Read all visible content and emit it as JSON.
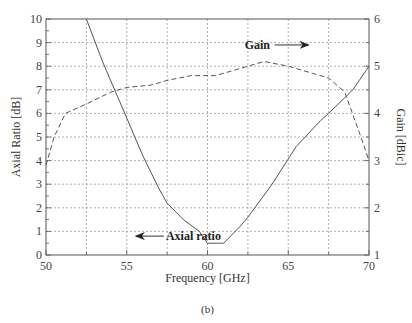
{
  "chart_data": {
    "type": "line",
    "title": "",
    "caption": "(b)",
    "xlabel": "Frequency [GHz]",
    "ylabel_left": "Axial Ratio [dB]",
    "ylabel_right": "Gain [dBic]",
    "xlim": [
      50,
      70
    ],
    "ylim_left": [
      0,
      10
    ],
    "ylim_right": [
      1,
      6
    ],
    "x_ticks": [
      "50",
      "55",
      "60",
      "65",
      "70"
    ],
    "y_left_ticks": [
      "0",
      "1",
      "2",
      "3",
      "4",
      "5",
      "6",
      "7",
      "8",
      "9",
      "10"
    ],
    "y_right_ticks": [
      "1",
      "2",
      "3",
      "4",
      "5",
      "6"
    ],
    "grid": true,
    "series": [
      {
        "name": "Axial ratio",
        "axis": "left",
        "style": "solid",
        "x": [
          52.5,
          53.5,
          55,
          56,
          57,
          57.5,
          58.5,
          59.5,
          60,
          61,
          62,
          62.5,
          64,
          65.5,
          67,
          67.5,
          69,
          70
        ],
        "values": [
          10,
          8.2,
          5.8,
          4.2,
          2.8,
          2.2,
          1.5,
          1.0,
          0.5,
          0.5,
          1.2,
          1.6,
          3.0,
          4.6,
          5.7,
          6.0,
          7.0,
          8.0
        ]
      },
      {
        "name": "Gain",
        "axis": "right",
        "style": "dashed",
        "x": [
          50,
          50.5,
          51.2,
          52.5,
          54,
          55,
          56.5,
          57.5,
          59,
          60.5,
          62,
          63.5,
          65,
          66.5,
          67.5,
          68.5,
          69.5,
          70
        ],
        "values": [
          2.9,
          3.5,
          4.0,
          4.2,
          4.45,
          4.55,
          4.6,
          4.7,
          4.8,
          4.8,
          4.95,
          5.1,
          5.0,
          4.85,
          4.75,
          4.45,
          3.5,
          3.0
        ]
      }
    ],
    "annotations": [
      {
        "text": "Gain",
        "arrow": "right",
        "x": 62.5,
        "y_left": 8.9
      },
      {
        "text": "Axial ratio",
        "arrow": "left",
        "x": 57.7,
        "y_left": 0.8
      }
    ]
  },
  "labels": {
    "x0": "50",
    "x1": "55",
    "x2": "60",
    "x3": "65",
    "x4": "70",
    "xlabel": "Frequency [GHz]",
    "ylabel_left": "Axial Ratio [dB]",
    "ylabel_right": "Gain [dBic]",
    "gain_annot": "Gain",
    "ar_annot": "Axial ratio",
    "caption": "(b)"
  }
}
